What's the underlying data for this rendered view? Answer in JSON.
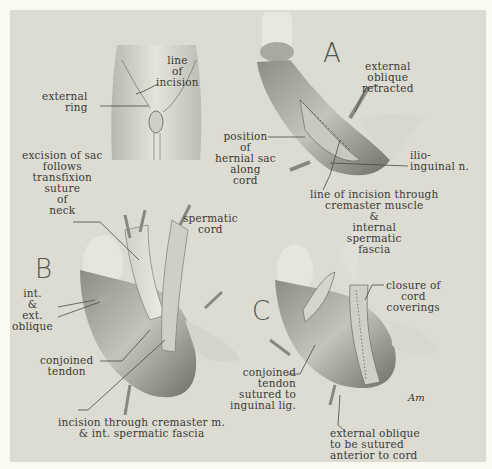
{
  "figure": {
    "background_color": "#fbfaf1",
    "plate_color": "#dcdcd3",
    "ink_color": "#3a3a36",
    "panels": {
      "overview": {
        "labels": {
          "external_ring": "external\nring",
          "line_of_incision": "line\nof\nincision"
        }
      },
      "A": {
        "letter": "A",
        "labels": {
          "external_oblique_retracted": "external\noblique\nretracted",
          "position_of_hernial_sac": "position\nof\nhernial sac\nalong\ncord",
          "ilio_inguinal": "ilio-\ninguinal n.",
          "line_of_incision_through": "line of incision through\ncremaster muscle\n&\ninternal\nspermatic\nfascia"
        }
      },
      "B": {
        "letter": "B",
        "labels": {
          "excision_of_sac": "excision of sac\nfollows\ntransfixion\nsuture\nof\nneck",
          "spermatic_cord": "spermatic\ncord",
          "int_ext_oblique": "int.\n&\next.\noblique",
          "conjoined_tendon": "conjoined\ntendon",
          "incision_through_cremaster": "incision through cremaster m.\n& int. spermatic fascia"
        }
      },
      "C": {
        "letter": "C",
        "labels": {
          "closure_of_cord_coverings": "closure of\ncord\ncoverings",
          "conjoined_tendon_sutured": "conjoined\ntendon\nsutured to\ninguinal lig.",
          "external_oblique_to_be_sutured": "external oblique\nto be sutured\nanterior to cord"
        }
      }
    },
    "signature": "Am"
  }
}
